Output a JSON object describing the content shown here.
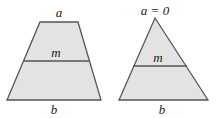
{
  "figure": {
    "trapezoid": {
      "top_label": "a",
      "mid_label": "m",
      "bottom_label": "b",
      "fill": "#e3e3e3",
      "stroke": "#555555"
    },
    "triangle": {
      "top_label": "a = 0",
      "mid_label": "m",
      "bottom_label": "b",
      "fill": "#e3e3e3",
      "stroke": "#555555"
    }
  }
}
